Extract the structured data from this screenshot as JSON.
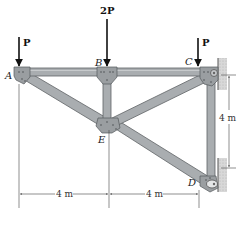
{
  "figure": {
    "type": "truss-diagram",
    "joints": {
      "A": "A",
      "B": "B",
      "C": "C",
      "D": "D",
      "E": "E"
    },
    "loads": {
      "at_A": "P",
      "at_B": "2P",
      "at_C": "P"
    },
    "dimensions": {
      "horizontal_left": "4 m",
      "horizontal_right": "4 m",
      "vertical_right": "4 m"
    },
    "supports": {
      "C": "pin-wall",
      "D": "roller-wall"
    },
    "members": [
      "AB",
      "BC",
      "BE",
      "AE",
      "CE",
      "ED",
      "CD"
    ],
    "colors": {
      "member_fill": "#a9adb0",
      "member_edge": "#5f6366",
      "gusset": "#9a9ea1",
      "wall": "#cfcfcf",
      "arrow": "#111111",
      "dimension": "#444444"
    }
  }
}
